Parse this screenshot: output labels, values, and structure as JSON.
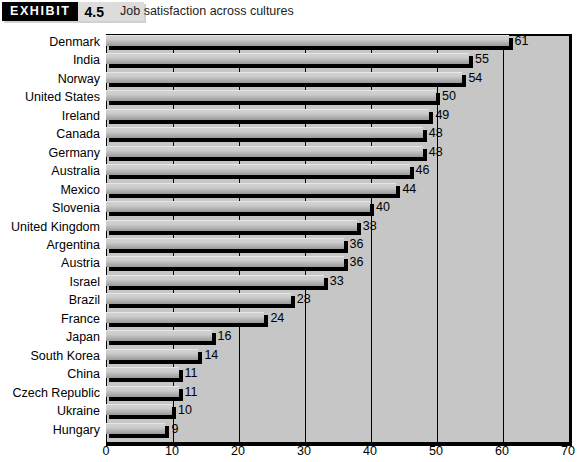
{
  "header": {
    "badge_word": "EXHIBIT",
    "badge_number": "4.5",
    "title": "Job satisfaction across cultures"
  },
  "chart_data": {
    "type": "bar",
    "orientation": "horizontal",
    "title": "Job satisfaction across cultures",
    "xlabel": "Percent very satisfied",
    "ylabel": "",
    "xlim": [
      0,
      70
    ],
    "xticks": [
      0,
      10,
      20,
      30,
      40,
      50,
      60,
      70
    ],
    "grid": true,
    "grid_axis": "x",
    "legend": null,
    "value_labels": true,
    "categories": [
      "Denmark",
      "India",
      "Norway",
      "United States",
      "Ireland",
      "Canada",
      "Germany",
      "Australia",
      "Mexico",
      "Slovenia",
      "United Kingdom",
      "Argentina",
      "Austria",
      "Israel",
      "Brazil",
      "France",
      "Japan",
      "South Korea",
      "China",
      "Czech Republic",
      "Ukraine",
      "Hungary"
    ],
    "values": [
      61,
      55,
      54,
      50,
      49,
      48,
      48,
      46,
      44,
      40,
      38,
      36,
      36,
      33,
      28,
      24,
      16,
      14,
      11,
      11,
      10,
      9
    ],
    "colors": {
      "plot_background": "#c6c6c6",
      "bar_fill": "#c8c8c8",
      "bar_shadow": "#000000",
      "axis": "#000000",
      "text": "#000000"
    }
  }
}
